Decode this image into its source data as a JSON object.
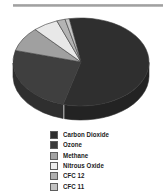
{
  "figure": {
    "has_top_rule": true,
    "top_rule_color": "#a5a5a5",
    "background": "#ffffff"
  },
  "chart_data": {
    "type": "pie",
    "title": "",
    "subtitle": "",
    "xlabel": "",
    "ylabel": "",
    "three_d": true,
    "legend_position": "bottom",
    "grid": false,
    "categories": [
      "Carbon Dioxide",
      "Ozone",
      "Methane",
      "Nitrous Oxide",
      "CFC 12",
      "CFC 11"
    ],
    "values": [
      57,
      25,
      9,
      6,
      2,
      1
    ],
    "units": "percent",
    "colors": [
      "#2f2f2f",
      "#3f3f3f",
      "#a0a0a0",
      "#e8e8e8",
      "#b4b4b4",
      "#c6c6c6"
    ],
    "slices": [
      {
        "label": "Carbon Dioxide",
        "value": 57,
        "color": "#2f2f2f"
      },
      {
        "label": "Ozone",
        "value": 25,
        "color": "#3f3f3f"
      },
      {
        "label": "Methane",
        "value": 9,
        "color": "#a0a0a0"
      },
      {
        "label": "Nitrous Oxide",
        "value": 6,
        "color": "#e8e8e8"
      },
      {
        "label": "CFC 12",
        "value": 2,
        "color": "#b4b4b4"
      },
      {
        "label": "CFC 11",
        "value": 1,
        "color": "#c6c6c6"
      }
    ]
  },
  "legend": {
    "items": [
      {
        "label": "Carbon Dioxide",
        "color": "#2f2f2f"
      },
      {
        "label": "Ozone",
        "color": "#3a3a3a"
      },
      {
        "label": "Methane",
        "color": "#a2a2a2"
      },
      {
        "label": "Nitrous Oxide",
        "color": "#ededed"
      },
      {
        "label": "CFC 12",
        "color": "#b0b0b0"
      },
      {
        "label": "CFC 11",
        "color": "#c2c2c2"
      }
    ]
  }
}
